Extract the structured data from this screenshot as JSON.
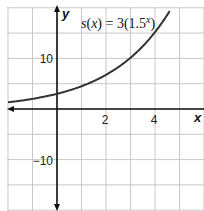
{
  "chart_data": {
    "type": "line",
    "title": "",
    "equation_label": "s(x) = 3(1.5ˣ)",
    "equation_parts": {
      "lhs": "s(x) = 3(1.5",
      "exp": "x",
      "close": ")"
    },
    "xlabel": "x",
    "ylabel": "y",
    "xlim": [
      -2,
      6
    ],
    "ylim": [
      -20,
      20
    ],
    "x_ticks": [
      {
        "value": 2,
        "label": "2"
      },
      {
        "value": 4,
        "label": "4"
      }
    ],
    "y_ticks": [
      {
        "value": 10,
        "label": "10"
      },
      {
        "value": -10,
        "label": "−10"
      }
    ],
    "grid": {
      "on": true,
      "x_step": 1,
      "y_step": 5
    },
    "series": [
      {
        "name": "s(x) = 3(1.5^x)",
        "function": "3*1.5^x",
        "x": [
          -2,
          -1,
          0,
          1,
          2,
          3,
          4,
          4.57
        ],
        "values": [
          1.33,
          2,
          3,
          4.5,
          6.75,
          10.13,
          15.19,
          19.9
        ],
        "color": "#333333"
      }
    ],
    "colors": {
      "grid": "#c8c8c8",
      "axis": "#111111",
      "curve": "#333333"
    }
  }
}
